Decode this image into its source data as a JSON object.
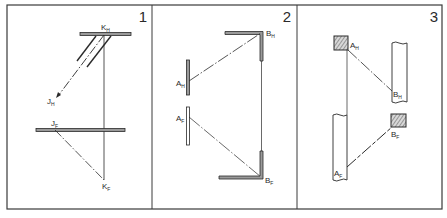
{
  "figure": {
    "type": "descriptive-geometry projections",
    "colors": {
      "ink": "#2a2a2a",
      "paper": "#ffffff",
      "bar_fill": "#9a9a9a",
      "hatch": "#555555"
    },
    "panels": [
      {
        "number": "1",
        "labels": {
          "kh": "K",
          "kh_sub": "H",
          "jh": "J",
          "jh_sub": "H",
          "jf": "J",
          "jf_sub": "F",
          "kf": "K",
          "kf_sub": "F"
        }
      },
      {
        "number": "2",
        "labels": {
          "bh": "B",
          "bh_sub": "H",
          "ah": "A",
          "ah_sub": "H",
          "af": "A",
          "af_sub": "F",
          "bf": "B",
          "bf_sub": "F"
        }
      },
      {
        "number": "3",
        "labels": {
          "ah": "A",
          "ah_sub": "H",
          "bh": "B",
          "bh_sub": "H",
          "af": "A",
          "af_sub": "F",
          "bf": "B",
          "bf_sub": "F"
        }
      }
    ]
  }
}
